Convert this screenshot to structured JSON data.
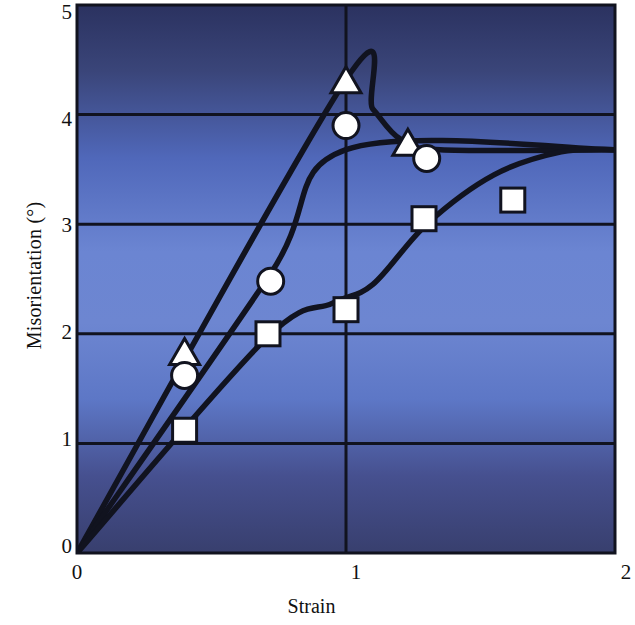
{
  "chart_data": {
    "type": "line",
    "title": "",
    "xlabel": "Strain",
    "ylabel": "Misorientation (°)",
    "xlim": [
      0,
      2
    ],
    "ylim": [
      0,
      5
    ],
    "xticks": [
      "0",
      "1",
      "2"
    ],
    "xtick_values": [
      0,
      1,
      2
    ],
    "yticks": [
      "0",
      "1",
      "2",
      "3",
      "4",
      "5"
    ],
    "ytick_values": [
      0,
      1,
      2,
      3,
      4,
      5
    ],
    "grid": "horizontal gridlines at 1,2,3,4 and vertical gridline at x=1",
    "legend": "none",
    "background": "blue vertical gradient, dark navy at top and bottom, lighter blue in middle",
    "series": [
      {
        "name": "triangle",
        "marker": "triangle",
        "points": [
          {
            "x": 0.4,
            "y": 1.82
          },
          {
            "x": 1.0,
            "y": 4.3
          },
          {
            "x": 1.23,
            "y": 3.73
          }
        ],
        "line_path": [
          {
            "x": 0.0,
            "y": 0.0
          },
          {
            "x": 1.0,
            "y": 4.32
          },
          {
            "x": 1.1,
            "y": 4.05
          },
          {
            "x": 1.2,
            "y": 3.78
          },
          {
            "x": 1.35,
            "y": 3.68
          },
          {
            "x": 2.0,
            "y": 3.68
          }
        ]
      },
      {
        "name": "circle",
        "marker": "circle",
        "points": [
          {
            "x": 0.4,
            "y": 1.62
          },
          {
            "x": 0.72,
            "y": 2.48
          },
          {
            "x": 1.0,
            "y": 3.9
          },
          {
            "x": 1.3,
            "y": 3.6
          }
        ],
        "line_path": [
          {
            "x": 0.0,
            "y": 0.0
          },
          {
            "x": 0.72,
            "y": 2.55
          },
          {
            "x": 1.0,
            "y": 3.68
          },
          {
            "x": 2.0,
            "y": 3.68
          }
        ]
      },
      {
        "name": "square",
        "marker": "square",
        "points": [
          {
            "x": 0.4,
            "y": 1.12
          },
          {
            "x": 0.71,
            "y": 2.0
          },
          {
            "x": 1.0,
            "y": 2.22
          },
          {
            "x": 1.29,
            "y": 3.05
          },
          {
            "x": 1.62,
            "y": 3.22
          }
        ],
        "line_path": [
          {
            "x": 0.0,
            "y": 0.0
          },
          {
            "x": 0.7,
            "y": 1.95
          },
          {
            "x": 0.95,
            "y": 2.28
          },
          {
            "x": 1.1,
            "y": 2.45
          },
          {
            "x": 1.3,
            "y": 3.0
          },
          {
            "x": 1.55,
            "y": 3.45
          },
          {
            "x": 1.8,
            "y": 3.66
          },
          {
            "x": 2.0,
            "y": 3.68
          }
        ]
      }
    ],
    "colors": {
      "line": "#11131f",
      "marker_fill": "#ffffff",
      "marker_edge": "#11131f",
      "axis": "#11131f",
      "bg_top": "#2d3566",
      "bg_mid": "#6d86d1",
      "bg_bottom": "#3a4272",
      "text": "#111111"
    }
  }
}
